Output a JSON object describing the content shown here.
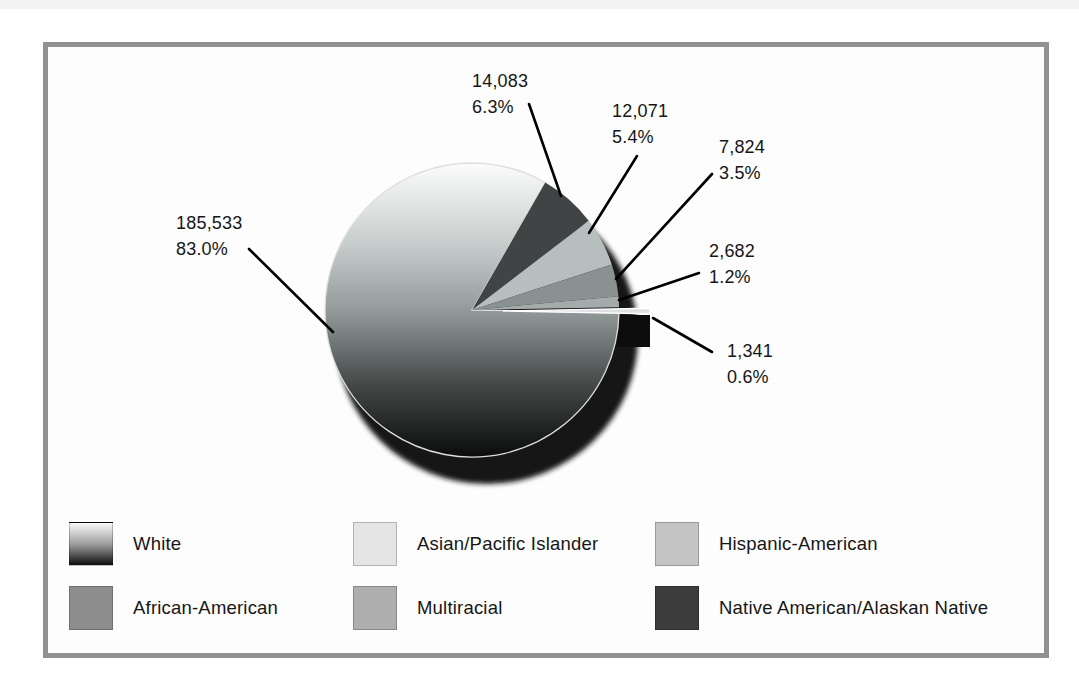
{
  "chart_data": {
    "type": "pie",
    "title": "",
    "labels_format": "value and percent on callouts",
    "slices": [
      {
        "label": "White",
        "value": "185,533",
        "pct": "83.0%",
        "pct_num": 83.0,
        "color": "gradient",
        "exploded": false
      },
      {
        "label": "Native American/Alaskan Native",
        "value": "14,083",
        "pct": "6.3%",
        "pct_num": 6.3,
        "color": "#404444",
        "exploded": false
      },
      {
        "label": "Hispanic-American",
        "value": "12,071",
        "pct": "5.4%",
        "pct_num": 5.4,
        "color": "#b7bebe",
        "exploded": false
      },
      {
        "label": "African-American",
        "value": "7,824",
        "pct": "3.5%",
        "pct_num": 3.5,
        "color": "#8a9191",
        "exploded": false
      },
      {
        "label": "Multiracial",
        "value": "2,682",
        "pct": "1.2%",
        "pct_num": 1.2,
        "color": "#a4abab",
        "exploded": false
      },
      {
        "label": "Asian/Pacific Islander",
        "value": "1,341",
        "pct": "0.6%",
        "pct_num": 0.6,
        "color": "#dce0e0",
        "exploded": true
      }
    ],
    "legend": [
      {
        "label": "White",
        "swatch": "gradient"
      },
      {
        "label": "Asian/Pacific Islander",
        "swatch": "#e4e4e4"
      },
      {
        "label": "Hispanic-American",
        "swatch": "#c4c4c4"
      },
      {
        "label": "African-American",
        "swatch": "#8d8d8d"
      },
      {
        "label": "Multiracial",
        "swatch": "#aeaeae"
      },
      {
        "label": "Native American/Alaskan Native",
        "swatch": "#3c3c3c"
      }
    ],
    "legend_position": "bottom, two rows of three",
    "colors": {
      "frame_border": "#919191",
      "panel_background": "#fdfdfd",
      "text": "#161616",
      "leader_line": "#000000",
      "shadow": "#151515",
      "white_slice_gradient_top": "#fcfcfc",
      "white_slice_gradient_bottom": "#0b0b0b"
    }
  }
}
